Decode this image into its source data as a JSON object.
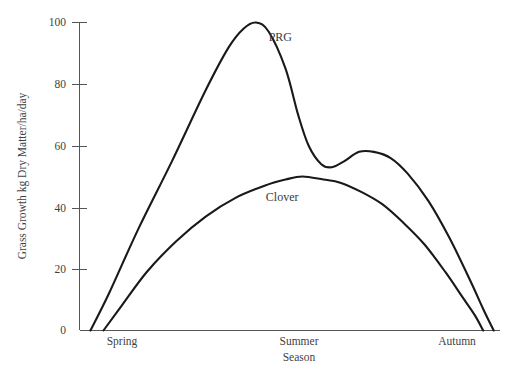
{
  "chart_data": {
    "type": "line",
    "title": "",
    "xlabel": "Season",
    "ylabel": "Grass Growth kg Dry Matter/ha/day",
    "ylim": [
      0,
      100
    ],
    "yticks": [
      0,
      20,
      40,
      60,
      80,
      100
    ],
    "ytick_labels": [
      "0",
      "20",
      "40",
      "60",
      "80",
      "100"
    ],
    "categories": [
      "Spring",
      "Summer",
      "Autumn"
    ],
    "grid": false,
    "legend": "inline-annotations",
    "series": [
      {
        "name": "PRG",
        "label_text": "PRG",
        "color": "#191919",
        "x": [
          0.026,
          0.07,
          0.14,
          0.22,
          0.3,
          0.355,
          0.39,
          0.42,
          0.45,
          0.49,
          0.52,
          0.545,
          0.575,
          0.6,
          0.63,
          0.665,
          0.7,
          0.74,
          0.78,
          0.83,
          0.88,
          0.93,
          0.96,
          0.985
        ],
        "values": [
          0,
          12,
          33,
          55,
          78,
          92,
          98,
          100,
          97,
          85,
          70,
          60,
          54,
          53,
          55,
          58,
          58,
          56,
          51,
          42,
          30,
          16,
          7,
          0
        ]
      },
      {
        "name": "Clover",
        "label_text": "Clover",
        "color": "#191919",
        "x": [
          0.057,
          0.1,
          0.16,
          0.23,
          0.3,
          0.37,
          0.44,
          0.49,
          0.53,
          0.58,
          0.62,
          0.67,
          0.72,
          0.77,
          0.82,
          0.87,
          0.91,
          0.94,
          0.96
        ],
        "values": [
          0,
          8,
          19,
          29,
          37,
          43,
          47,
          49,
          50,
          49,
          48,
          45,
          41,
          35,
          28,
          19,
          11,
          5,
          0
        ]
      }
    ],
    "annotations": [
      {
        "text": "PRG",
        "x_frac": 0.45,
        "y_value": 94
      },
      {
        "text": "Clover",
        "x_frac": 0.443,
        "y_value": 42
      }
    ]
  }
}
